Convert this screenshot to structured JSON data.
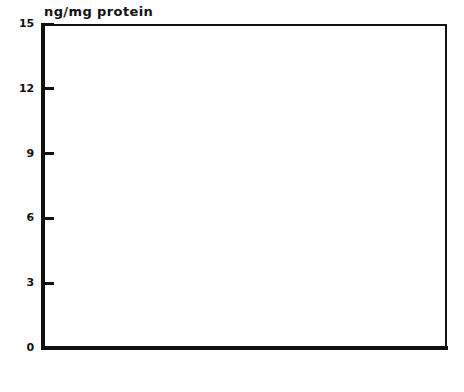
{
  "chart_data": {
    "type": "bar",
    "title": "",
    "subtitle": "",
    "xlabel": "",
    "ylabel": "ng/mg protein",
    "ylim": [
      0,
      15
    ],
    "yticks": [
      0,
      3,
      6,
      9,
      12,
      15
    ],
    "ytick_labels": [
      "0",
      "3",
      "6",
      "9",
      "12",
      "15"
    ],
    "grid": false,
    "legend_position": "none",
    "categories": [
      "beta-endorphin",
      "substance P",
      "met-enkephalin",
      "somatostatin"
    ],
    "series": [
      {
        "name": "open",
        "fill": "white",
        "values": [
          0,
          2.5,
          1.0,
          0.15
        ],
        "errors": [
          0,
          0.8,
          0.7,
          0.35
        ]
      },
      {
        "name": "hatched",
        "fill": "diagonal-hatch",
        "values": [
          0,
          2.5,
          12.9,
          0.3
        ],
        "errors": [
          0,
          2.0,
          0.0,
          0.55
        ]
      }
    ],
    "annotations": [
      {
        "kind": "significance-marker",
        "symbol": "*",
        "category": "met-enkephalin",
        "series": "hatched",
        "y": 13.8
      },
      {
        "kind": "zero-marker",
        "symbol": "o",
        "category": "beta-endorphin",
        "series": "open",
        "y": 0.15
      },
      {
        "kind": "zero-marker",
        "symbol": "o",
        "category": "beta-endorphin",
        "series": "hatched",
        "y": 0.15
      }
    ],
    "colors": {
      "ink": "#111111",
      "background": "#ffffff"
    }
  },
  "axis": {
    "title": "ng/mg protein"
  },
  "yticks": [
    {
      "label": "15",
      "value": 15
    },
    {
      "label": "12",
      "value": 12
    },
    {
      "label": "9",
      "value": 9
    },
    {
      "label": "6",
      "value": 6
    },
    {
      "label": "3",
      "value": 3
    },
    {
      "label": "0",
      "value": 0
    }
  ],
  "categories": [
    {
      "label": "beta-endorphin"
    },
    {
      "label": "substance P"
    },
    {
      "label": "met-enkephalin"
    },
    {
      "label": "somatostatin"
    }
  ]
}
